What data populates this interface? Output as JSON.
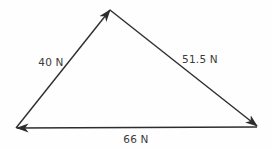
{
  "diagram": {
    "type": "force-vector-triangle",
    "vectors": [
      {
        "label": "40 N",
        "magnitude": 40,
        "unit": "N",
        "from": "bottom-left-vertex",
        "to": "apex-vertex",
        "arrowhead_at": "apex-vertex"
      },
      {
        "label": "51.5 N",
        "magnitude": 51.5,
        "unit": "N",
        "from": "apex-vertex",
        "to": "bottom-right-vertex",
        "arrowhead_at": "bottom-right-vertex"
      },
      {
        "label": "66 N",
        "magnitude": 66,
        "unit": "N",
        "from": "bottom-right-vertex",
        "to": "bottom-left-vertex",
        "arrowhead_at": "bottom-left-vertex"
      }
    ],
    "colors": {
      "line": "#2d2d2d",
      "text": "#3b3b3b",
      "background": "#fefefe"
    }
  }
}
